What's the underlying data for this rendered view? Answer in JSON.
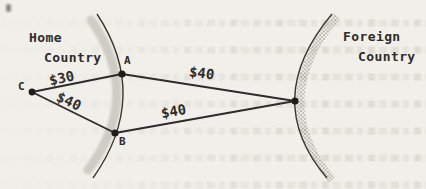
{
  "figure": {
    "home_region": {
      "line1": "Home",
      "line2": "Country"
    },
    "foreign_region": {
      "line1": "Foreign",
      "line2": "Country"
    },
    "nodes": {
      "a": "A",
      "b": "B",
      "c": "C"
    },
    "costs": {
      "c_to_a": "$30",
      "c_to_b": "$40",
      "a_to_foreign": "$40",
      "b_to_foreign": "$40"
    },
    "colors": {
      "paper": "#f1efe9",
      "ink": "#2e2c29",
      "home_coast_shade": "#cfccc5",
      "foreign_coast_stipple": "#8f8a82"
    }
  }
}
